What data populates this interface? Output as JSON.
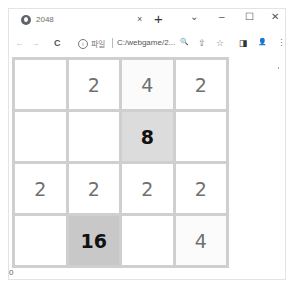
{
  "browser": {
    "tab": {
      "title": "2048",
      "close_glyph": "×"
    },
    "newtab_glyph": "+",
    "window_controls": {
      "dropdown": "⌄",
      "minimize": "–",
      "maximize": "☐",
      "close": "✕"
    },
    "toolbar": {
      "back_glyph": "←",
      "forward_glyph": "→",
      "reload_glyph": "C",
      "info_glyph": "i",
      "scheme_label": "파일",
      "url": "C:/webgame/2...",
      "zoom_glyph": "🔍",
      "share_glyph": "⇪",
      "bookmark_glyph": "☆",
      "sidepanel_glyph": "◨",
      "profile_glyph": "👤",
      "menu_glyph": "⋮"
    }
  },
  "game": {
    "board": [
      [
        "",
        "2",
        "4",
        "2"
      ],
      [
        "",
        "",
        "8",
        ""
      ],
      [
        "2",
        "2",
        "2",
        "2"
      ],
      [
        "",
        "16",
        "",
        "4"
      ]
    ],
    "score": "0"
  }
}
